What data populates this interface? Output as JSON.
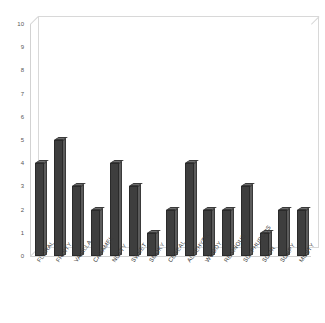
{
  "chart_data": {
    "type": "bar",
    "title": "",
    "subtitle": "",
    "xlabel": "",
    "ylabel": "",
    "ylim": [
      0,
      10
    ],
    "ytick_step": 1,
    "yticks": [
      "10",
      "9",
      "8",
      "7",
      "6",
      "5",
      "4",
      "3",
      "2",
      "1",
      "0"
    ],
    "grid": false,
    "legend": null,
    "legend_position": "none",
    "style": "3d-column",
    "categories": [
      "FLORAL",
      "FRUITY",
      "VANILLA",
      "CARAMEL",
      "NUTTY",
      "SWEET",
      "SMOKY",
      "CEREAL",
      "ALDEHYDIC",
      "WOODY",
      "RESINOUS",
      "SULPHUROUS",
      "SOUR",
      "SOAPY",
      "MUSTY"
    ],
    "values": [
      4,
      5,
      3,
      2,
      4,
      3,
      1,
      2,
      4,
      2,
      2,
      3,
      1,
      2,
      2
    ],
    "colors": {
      "bar_face": "#3e3e3e",
      "bar_side": "#5c5c5c",
      "bar_top": "#6e6e6e",
      "bar_outline": "#2a2a2a",
      "axis_line": "#d2d2d2",
      "tick_text": "#555555",
      "category_text": "#3a3a3a",
      "plot_background": "#ffffff"
    }
  }
}
